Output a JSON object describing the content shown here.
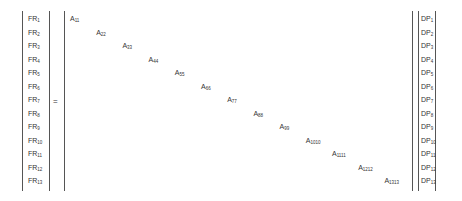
{
  "equation": {
    "operator": "=",
    "fr_vector": [
      {
        "base": "FR",
        "sub": "1"
      },
      {
        "base": "FR",
        "sub": "2"
      },
      {
        "base": "FR",
        "sub": "3"
      },
      {
        "base": "FR",
        "sub": "4"
      },
      {
        "base": "FR",
        "sub": "5"
      },
      {
        "base": "FR",
        "sub": "6"
      },
      {
        "base": "FR",
        "sub": "7"
      },
      {
        "base": "FR",
        "sub": "8"
      },
      {
        "base": "FR",
        "sub": "9"
      },
      {
        "base": "FR",
        "sub": "10"
      },
      {
        "base": "FR",
        "sub": "11"
      },
      {
        "base": "FR",
        "sub": "12"
      },
      {
        "base": "FR",
        "sub": "13"
      }
    ],
    "matrix_diagonal": [
      {
        "base": "A",
        "sub": "11"
      },
      {
        "base": "A",
        "sub": "22"
      },
      {
        "base": "A",
        "sub": "33"
      },
      {
        "base": "A",
        "sub": "44"
      },
      {
        "base": "A",
        "sub": "55"
      },
      {
        "base": "A",
        "sub": "66"
      },
      {
        "base": "A",
        "sub": "77"
      },
      {
        "base": "A",
        "sub": "88"
      },
      {
        "base": "A",
        "sub": "99"
      },
      {
        "base": "A",
        "sub": "1010"
      },
      {
        "base": "A",
        "sub": "1111"
      },
      {
        "base": "A",
        "sub": "1212"
      },
      {
        "base": "A",
        "sub": "1313"
      }
    ],
    "dp_vector": [
      {
        "base": "DP",
        "sub": "1"
      },
      {
        "base": "DP",
        "sub": "2"
      },
      {
        "base": "DP",
        "sub": "3"
      },
      {
        "base": "DP",
        "sub": "4"
      },
      {
        "base": "DP",
        "sub": "5"
      },
      {
        "base": "DP",
        "sub": "6"
      },
      {
        "base": "DP",
        "sub": "7"
      },
      {
        "base": "DP",
        "sub": "8"
      },
      {
        "base": "DP",
        "sub": "9"
      },
      {
        "base": "DP",
        "sub": "10"
      },
      {
        "base": "DP",
        "sub": "11"
      },
      {
        "base": "DP",
        "sub": "12"
      },
      {
        "base": "DP",
        "sub": "13"
      }
    ]
  }
}
